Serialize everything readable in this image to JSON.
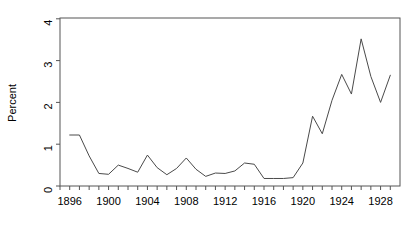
{
  "chart_data": {
    "type": "line",
    "title": "",
    "xlabel": "",
    "ylabel": "Percent",
    "xlim": [
      1895,
      1930
    ],
    "ylim": [
      0,
      4.2
    ],
    "grid": false,
    "legend": null,
    "y_ticks": [
      "0",
      "1",
      "2",
      "3",
      "4"
    ],
    "y_tick_values": [
      0,
      1,
      2,
      3,
      4
    ],
    "x_ticks": [
      "1896",
      "1900",
      "1904",
      "1908",
      "1912",
      "1916",
      "1920",
      "1924",
      "1928"
    ],
    "x_tick_values": [
      1896,
      1900,
      1904,
      1908,
      1912,
      1916,
      1920,
      1924,
      1928
    ],
    "x_minor_tick_values": [
      1895,
      1896,
      1897,
      1898,
      1899,
      1900,
      1901,
      1902,
      1903,
      1904,
      1905,
      1906,
      1907,
      1908,
      1909,
      1910,
      1911,
      1912,
      1913,
      1914,
      1915,
      1916,
      1917,
      1918,
      1919,
      1920,
      1921,
      1922,
      1923,
      1924,
      1925,
      1926,
      1927,
      1928,
      1929
    ],
    "x": [
      1896,
      1897,
      1898,
      1899,
      1900,
      1901,
      1902,
      1903,
      1904,
      1905,
      1906,
      1907,
      1908,
      1909,
      1910,
      1911,
      1912,
      1913,
      1914,
      1915,
      1916,
      1917,
      1918,
      1919,
      1920,
      1921,
      1922,
      1923,
      1924,
      1925,
      1926,
      1927,
      1928,
      1929
    ],
    "values": [
      1.22,
      1.22,
      0.72,
      0.3,
      0.28,
      0.5,
      0.42,
      0.33,
      0.74,
      0.44,
      0.27,
      0.42,
      0.67,
      0.4,
      0.23,
      0.31,
      0.3,
      0.36,
      0.55,
      0.52,
      0.18,
      0.18,
      0.18,
      0.2,
      0.55,
      1.67,
      1.25,
      2.05,
      2.67,
      2.2,
      3.52,
      2.62,
      2.0,
      2.65
    ],
    "line_color": "#4a4a4a",
    "axis_color": "#555555",
    "background": "#ffffff"
  }
}
